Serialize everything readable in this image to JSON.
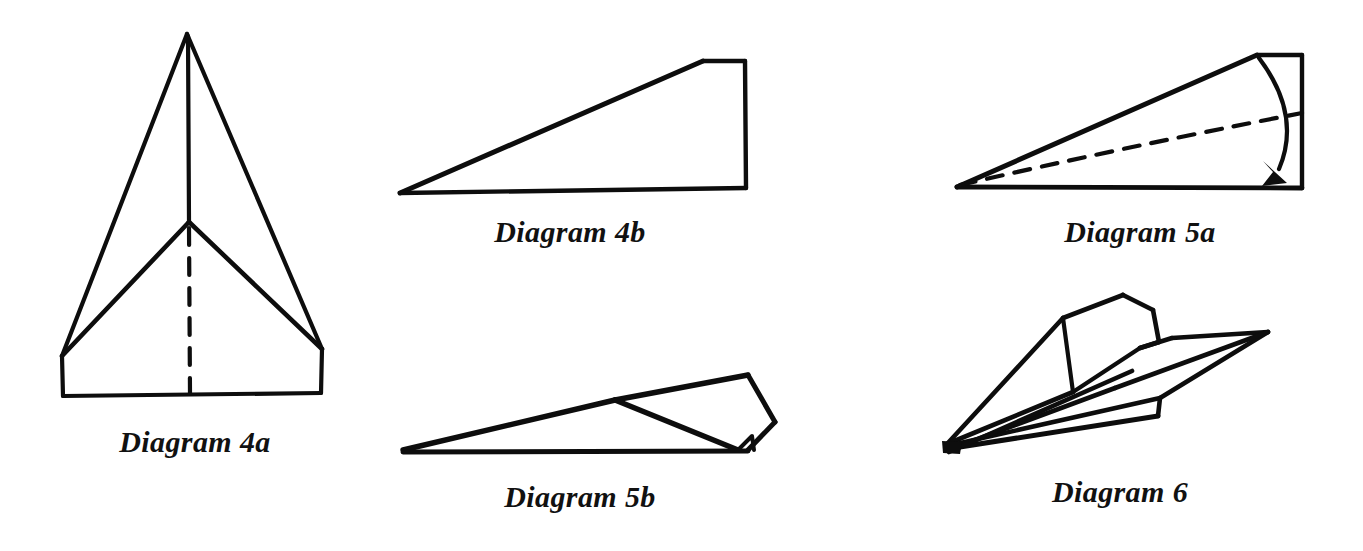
{
  "page": {
    "background_color": "#ffffff",
    "ink_color": "#0d0d0d",
    "width": 1363,
    "height": 551
  },
  "panels": [
    {
      "id": "4a",
      "caption": "Diagram 4a",
      "figure_name": "front-view-folded-paper-triangle",
      "description": "Symmetric front/plan view of a folded sheet: tall outer triangle with apex at top, a vertical center fold line from apex to mid junction, two inner fold lines fanning down-left and down-right from the junction, a dashed vertical center crease below the junction, and a short rectangular base band at the bottom.",
      "has_dashed_line": true,
      "has_arrow": false
    },
    {
      "id": "4b",
      "caption": "Diagram 4b",
      "figure_name": "side-view-long-wedge",
      "description": "Side view: a long thin wedge (right triangle) with the sharp point at the left, a long sloping hypotenuse rising to the right, a short horizontal top edge at top right, and a vertical right edge down to the flat horizontal base.",
      "has_dashed_line": false,
      "has_arrow": false
    },
    {
      "id": "5a",
      "caption": "Diagram 5a",
      "figure_name": "side-view-wedge-with-fold-arrow",
      "description": "Side view of the same wedge with a dashed fold line running from the left point to the right edge, and a curved arrow sweeping clockwise from the top right corner down to the bottom right corner indicating the wing is folded down.",
      "has_dashed_line": true,
      "has_arrow": true
    },
    {
      "id": "5b",
      "caption": "Diagram 5b",
      "figure_name": "side-view-wing-folded-down",
      "description": "Side view after the fold: long thin wedge with the point at the left, and at the right a folded quadrilateral wing flap hinged along a crease, with a small triangular notch where the flap meets the base line.",
      "has_dashed_line": false,
      "has_arrow": false
    },
    {
      "id": "6",
      "caption": "Diagram 6",
      "figure_name": "finished-paper-airplane-perspective",
      "description": "Three-quarter perspective of the completed paper airplane: sharp nose at lower left, swept-back wings and upright fin/tail planes at the upper right, with multiple layered fold edges converging at the nose.",
      "has_dashed_line": false,
      "has_arrow": false
    }
  ]
}
